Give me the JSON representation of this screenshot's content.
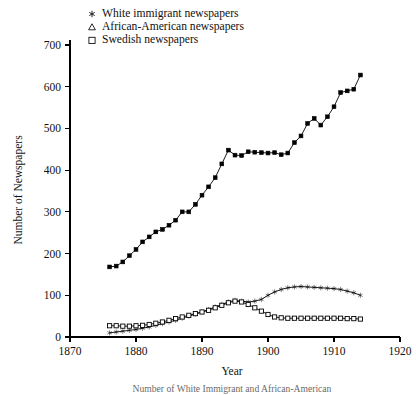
{
  "chart_data": {
    "type": "line",
    "title": "",
    "xlabel": "Year",
    "ylabel": "Number of Newspapers",
    "xlim": [
      1870,
      1920
    ],
    "ylim": [
      0,
      700
    ],
    "xticks": [
      1870,
      1880,
      1890,
      1900,
      1910,
      1920
    ],
    "yticks": [
      0,
      100,
      200,
      300,
      400,
      500,
      600,
      700
    ],
    "grid": false,
    "legend_position": "top-left-inside",
    "series": [
      {
        "name": "White immigrant newspapers",
        "marker": "star",
        "x": [
          1876,
          1877,
          1878,
          1879,
          1880,
          1881,
          1882,
          1883,
          1884,
          1885,
          1886,
          1887,
          1888,
          1889,
          1890,
          1891,
          1892,
          1893,
          1894,
          1895,
          1896,
          1897,
          1898,
          1899,
          1900,
          1901,
          1902,
          1903,
          1904,
          1905,
          1906,
          1907,
          1908,
          1909,
          1910,
          1911,
          1912,
          1913,
          1914
        ],
        "values": [
          168,
          170,
          180,
          195,
          210,
          228,
          240,
          252,
          258,
          268,
          280,
          300,
          300,
          318,
          340,
          360,
          382,
          415,
          448,
          436,
          435,
          444,
          443,
          442,
          441,
          442,
          437,
          441,
          466,
          482,
          512,
          524,
          508,
          528,
          552,
          586,
          590,
          594,
          628
        ]
      },
      {
        "name": "African-American newspapers",
        "marker": "triangle",
        "x": [
          1876,
          1877,
          1878,
          1879,
          1880,
          1881,
          1882,
          1883,
          1884,
          1885,
          1886,
          1887,
          1888,
          1889,
          1890,
          1891,
          1892,
          1893,
          1894,
          1895,
          1896,
          1897,
          1898,
          1899,
          1900,
          1901,
          1902,
          1903,
          1904,
          1905,
          1906,
          1907,
          1908,
          1909,
          1910,
          1911,
          1912,
          1913,
          1914
        ],
        "values": [
          10,
          12,
          14,
          16,
          18,
          21,
          24,
          28,
          32,
          36,
          40,
          45,
          50,
          55,
          60,
          66,
          72,
          78,
          84,
          88,
          86,
          84,
          86,
          90,
          100,
          108,
          114,
          118,
          120,
          121,
          120,
          119,
          118,
          117,
          116,
          114,
          110,
          106,
          100
        ]
      },
      {
        "name": "Swedish newspapers",
        "marker": "square",
        "x": [
          1876,
          1877,
          1878,
          1879,
          1880,
          1881,
          1882,
          1883,
          1884,
          1885,
          1886,
          1887,
          1888,
          1889,
          1890,
          1891,
          1892,
          1893,
          1894,
          1895,
          1896,
          1897,
          1898,
          1899,
          1900,
          1901,
          1902,
          1903,
          1904,
          1905,
          1906,
          1907,
          1908,
          1909,
          1910,
          1911,
          1912,
          1913,
          1914
        ],
        "values": [
          27,
          27,
          26,
          26,
          27,
          28,
          30,
          33,
          36,
          40,
          44,
          48,
          52,
          56,
          60,
          64,
          70,
          76,
          82,
          86,
          84,
          78,
          70,
          62,
          54,
          48,
          46,
          45,
          45,
          45,
          45,
          45,
          45,
          45,
          45,
          45,
          44,
          44,
          43
        ]
      }
    ]
  },
  "legend": {
    "items": [
      {
        "glyph": "star-glyph",
        "label": "White immigrant newspapers"
      },
      {
        "glyph": "triangle-glyph",
        "label": "African-American newspapers"
      },
      {
        "glyph": "square-glyph",
        "label": "Swedish newspapers"
      }
    ]
  },
  "caption": {
    "text": "Number of White Immigrant and African-American"
  }
}
